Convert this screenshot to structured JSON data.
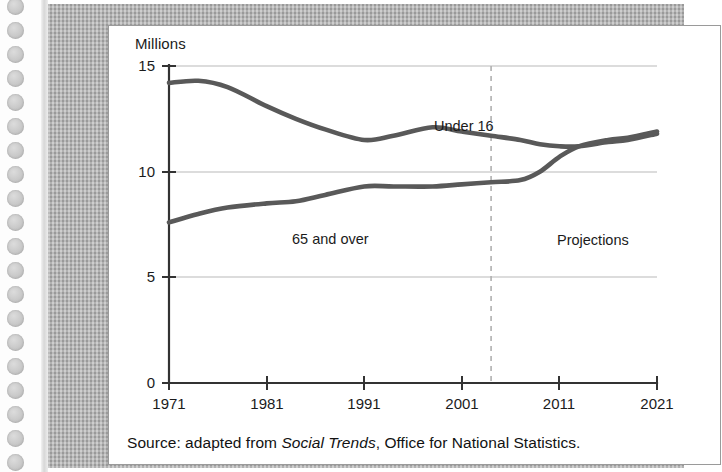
{
  "figure": {
    "caption_prefix": "Source: adapted from ",
    "caption_italic": "Social Trends",
    "caption_suffix": ", Office for National Statistics."
  },
  "chart_data": {
    "type": "line",
    "title": "",
    "subtitle": "",
    "xlabel": "",
    "ylabel": "Millions",
    "xlim": [
      1971,
      2021
    ],
    "ylim": [
      0,
      15
    ],
    "xticks": [
      1971,
      1981,
      1991,
      2001,
      2011,
      2021
    ],
    "yticks": [
      0,
      5,
      10,
      15
    ],
    "grid": "horizontal",
    "legend_position": "inline-annotations",
    "annotations": [
      {
        "text": "Under 16",
        "x": 1997,
        "y": 13.0
      },
      {
        "text": "65 and over",
        "x": 1980,
        "y": 7.2
      },
      {
        "text": "Projections",
        "x": 2005,
        "y": 7.1
      }
    ],
    "projection_divider": {
      "label": "Projections",
      "x": 2004
    },
    "x": [
      1971,
      1974,
      1977,
      1981,
      1984,
      1987,
      1991,
      1994,
      1998,
      2001,
      2004,
      2007,
      2009,
      2011,
      2013,
      2016,
      2018,
      2021
    ],
    "series": [
      {
        "name": "Under 16",
        "color": "#595959",
        "values": [
          14.2,
          14.3,
          14.0,
          13.1,
          12.5,
          12.0,
          11.5,
          11.7,
          12.1,
          11.9,
          11.7,
          11.5,
          11.3,
          11.2,
          11.2,
          11.4,
          11.5,
          11.8
        ]
      },
      {
        "name": "65 and over",
        "color": "#595959",
        "values": [
          7.6,
          8.0,
          8.3,
          8.5,
          8.6,
          8.9,
          9.3,
          9.3,
          9.3,
          9.4,
          9.5,
          9.6,
          10.0,
          10.7,
          11.2,
          11.5,
          11.6,
          11.9
        ]
      }
    ],
    "crossover": {
      "x": 2012,
      "y": 11.2,
      "note": "65 and over overtakes Under 16"
    }
  },
  "axis_labels": {
    "y": [
      "15",
      "10",
      "5",
      "0"
    ],
    "x": [
      "1971",
      "1981",
      "1991",
      "2001",
      "2011",
      "2021"
    ]
  },
  "colors": {
    "series_line": "#595959",
    "gridline": "#b9b9b9",
    "axis": "#333333",
    "frame": "#a8a8a8",
    "panel": "#ffffff",
    "text": "#1b1b1b"
  }
}
